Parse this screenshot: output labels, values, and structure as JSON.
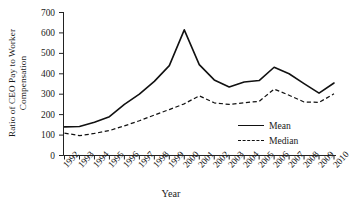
{
  "chart_data": {
    "type": "line",
    "title": "",
    "xlabel": "Year",
    "ylabel_lines": [
      "Ratio of CEO Pay to Worker",
      "Compensation"
    ],
    "ylabel": "Ratio of CEO Pay to Worker Compensation",
    "categories": [
      "1992",
      "1993",
      "1994",
      "1995",
      "1996",
      "1997",
      "1998",
      "1999",
      "2000",
      "2001",
      "2002",
      "2003",
      "2004",
      "2005",
      "2006",
      "2007",
      "2008",
      "2009",
      "2010"
    ],
    "x": [
      1992,
      1993,
      1994,
      1995,
      1996,
      1997,
      1998,
      1999,
      2000,
      2001,
      2002,
      2003,
      2004,
      2005,
      2006,
      2007,
      2008,
      2009,
      2010
    ],
    "yticks": [
      0,
      100,
      200,
      300,
      400,
      500,
      600,
      700
    ],
    "ylim": [
      0,
      700
    ],
    "grid": false,
    "legend_position": "right-inside",
    "series": [
      {
        "name": "Mean",
        "style": "solid",
        "color": "#111111",
        "values": [
          140,
          142,
          163,
          190,
          250,
          300,
          363,
          440,
          615,
          445,
          370,
          335,
          360,
          367,
          432,
          400,
          352,
          305,
          355
        ]
      },
      {
        "name": "Median",
        "style": "dashed",
        "color": "#111111",
        "values": [
          110,
          97,
          108,
          122,
          145,
          170,
          198,
          225,
          253,
          292,
          258,
          250,
          258,
          265,
          325,
          295,
          262,
          260,
          302
        ]
      }
    ]
  },
  "axis": {
    "ytick_labels": [
      "700",
      "600",
      "500",
      "400",
      "300",
      "200",
      "100",
      "0"
    ],
    "xtick_labels": [
      "1992",
      "1993",
      "1994",
      "1995",
      "1996",
      "1997",
      "1998",
      "1999",
      "2000",
      "2001",
      "2002",
      "2003",
      "2004",
      "2005",
      "2006",
      "2007",
      "2008",
      "2009",
      "2010"
    ]
  },
  "legend": {
    "items": [
      {
        "label": "Mean",
        "style": "solid"
      },
      {
        "label": "Median",
        "style": "dashed"
      }
    ]
  }
}
